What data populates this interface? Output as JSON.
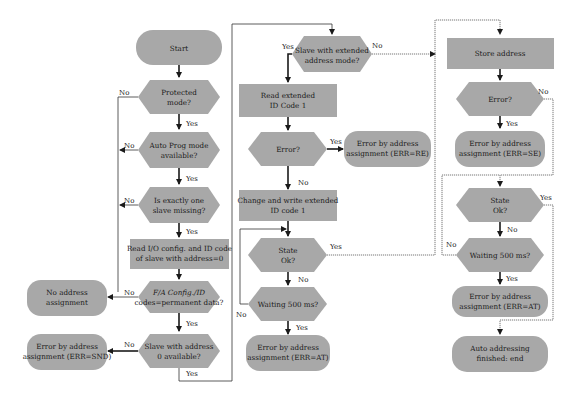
{
  "diagram": {
    "type": "flowchart",
    "title": "",
    "colors": {
      "node_fill": "#a8a8a8",
      "line": "#1a1a1a",
      "background": "#ffffff"
    },
    "nodes": {
      "start": {
        "shape": "terminal",
        "lines": [
          "Start"
        ]
      },
      "protected": {
        "shape": "decision",
        "lines": [
          "Protected",
          "mode?"
        ]
      },
      "autoprog": {
        "shape": "decision",
        "lines": [
          "Auto Prog mode",
          "available?"
        ]
      },
      "onemissing": {
        "shape": "decision",
        "lines": [
          "Is exactly one",
          "slave missing?"
        ]
      },
      "readio": {
        "shape": "process",
        "lines": [
          "Read I/O config. and ID code",
          "of slave with address=0"
        ]
      },
      "permanent": {
        "shape": "decision",
        "lines": [
          "F/A Config./ID",
          "codes=permanent data?"
        ]
      },
      "noaddr": {
        "shape": "terminal",
        "lines": [
          "No address",
          "assignment"
        ]
      },
      "slave0": {
        "shape": "decision",
        "lines": [
          "Slave with address",
          "0 available?"
        ]
      },
      "errsnd": {
        "shape": "terminal",
        "lines": [
          "Error by address",
          "assignment (ERR=SND)"
        ]
      },
      "extended": {
        "shape": "decision",
        "lines": [
          "Slave with extended",
          "address mode?"
        ]
      },
      "readext": {
        "shape": "process",
        "lines": [
          "Read extended",
          "ID Code 1"
        ]
      },
      "error1": {
        "shape": "decision",
        "lines": [
          "Error?"
        ]
      },
      "errre": {
        "shape": "terminal",
        "lines": [
          "Error by address",
          "assignment (ERR=RE)"
        ]
      },
      "changewrite": {
        "shape": "process",
        "lines": [
          "Change and write extended",
          "ID code 1"
        ]
      },
      "stateok1": {
        "shape": "decision",
        "lines": [
          "State",
          "Ok?"
        ]
      },
      "wait1": {
        "shape": "decision",
        "lines": [
          "Waiting 500 ms?"
        ]
      },
      "errat1": {
        "shape": "terminal",
        "lines": [
          "Error by address",
          "assignment (ERR=AT)"
        ]
      },
      "store": {
        "shape": "process",
        "lines": [
          "Store address"
        ]
      },
      "error2": {
        "shape": "decision",
        "lines": [
          "Error?"
        ]
      },
      "errse": {
        "shape": "terminal",
        "lines": [
          "Error by address",
          "assignment (ERR=SE)"
        ]
      },
      "stateok2": {
        "shape": "decision",
        "lines": [
          "State",
          "Ok?"
        ]
      },
      "wait2": {
        "shape": "decision",
        "lines": [
          "Waiting 500 ms?"
        ]
      },
      "errat2": {
        "shape": "terminal",
        "lines": [
          "Error by address",
          "assignment (ERR=AT)"
        ]
      },
      "end": {
        "shape": "terminal",
        "lines": [
          "Auto addressing",
          "finished: end"
        ]
      }
    },
    "edge_labels": {
      "protected_yes": "Yes",
      "protected_no": "No",
      "autoprog_yes": "Yes",
      "autoprog_no": "No",
      "onemissing_yes": "Yes",
      "onemissing_no": "No",
      "permanent_yes": "Yes",
      "permanent_no": "No",
      "slave0_yes": "Yes",
      "slave0_no": "No",
      "extended_yes": "Yes",
      "extended_no": "No",
      "error1_yes": "Yes",
      "error1_no": "No",
      "stateok1_yes": "Yes",
      "stateok1_no": "No",
      "wait1_yes": "Yes",
      "wait1_no": "No",
      "error2_yes": "Yes",
      "error2_no": "No",
      "stateok2_yes": "Yes",
      "stateok2_no": "No",
      "wait2_yes": "Yes",
      "wait2_no": "No"
    }
  }
}
